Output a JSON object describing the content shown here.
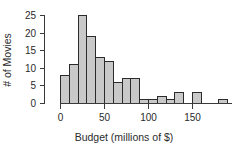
{
  "chart_data": {
    "type": "bar",
    "subtype": "histogram",
    "title": "",
    "subtitle": "",
    "xlabel": "Budget (millions of $)",
    "ylabel": "# of Movies",
    "xlim": [
      0,
      190
    ],
    "ylim": [
      0,
      25
    ],
    "xticks": [
      0,
      50,
      100,
      150
    ],
    "xtick_labels": [
      "0",
      "50",
      "100",
      "150"
    ],
    "yticks": [
      0,
      5,
      10,
      15,
      20,
      25
    ],
    "ytick_labels": [
      "0",
      "5",
      "10",
      "15",
      "20",
      "25"
    ],
    "grid": false,
    "legend": false,
    "legend_position": "none",
    "bin_width": 10,
    "bin_edges": [
      0,
      10,
      20,
      30,
      40,
      50,
      60,
      70,
      80,
      90,
      100,
      110,
      120,
      130,
      140,
      150,
      160,
      170,
      180,
      190
    ],
    "categories": [
      "0-10",
      "10-20",
      "20-30",
      "30-40",
      "40-50",
      "50-60",
      "60-70",
      "70-80",
      "80-90",
      "90-100",
      "100-110",
      "110-120",
      "120-130",
      "130-140",
      "140-150",
      "150-160",
      "160-170",
      "170-180",
      "180-190"
    ],
    "values": [
      8,
      11,
      25,
      19,
      13,
      12,
      6,
      7,
      7,
      1,
      1,
      2,
      1,
      3,
      0,
      3,
      0,
      0,
      1
    ],
    "bar_fill_color": "#c9c9c9",
    "bar_edge_color": "#2b2b2b",
    "axis_color": "#3a3a3a"
  }
}
